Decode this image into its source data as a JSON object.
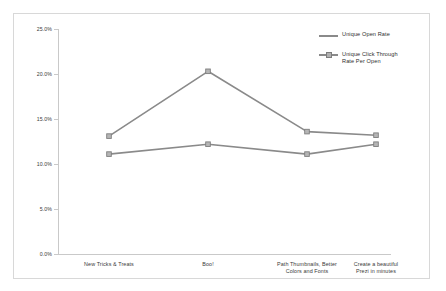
{
  "chart_data": {
    "type": "line",
    "title": "",
    "xlabel": "",
    "ylabel": "",
    "ylim": [
      0,
      25
    ],
    "ytick_values": [
      0,
      5,
      10,
      15,
      20,
      25
    ],
    "ytick_labels": [
      "0.0%",
      "5.0%",
      "10.0%",
      "15.0%",
      "20.0%",
      "25.0%"
    ],
    "grid": false,
    "legend_position": "top-right",
    "categories": [
      "New Tricks & Treats",
      "Boo!",
      "Path Thumbnails, Better\nColors and Fonts",
      "Create a beautiful\nPrezi in minutes"
    ],
    "series": [
      {
        "name": "Unique Open Rate",
        "color": "#8a8a8a",
        "marker": "square",
        "values": [
          13.1,
          20.3,
          13.6,
          13.2
        ]
      },
      {
        "name": "Unique Click Through\nRate Per Open",
        "color": "#8a8a8a",
        "marker": "square",
        "values": [
          11.1,
          12.2,
          11.1,
          12.2
        ]
      }
    ]
  },
  "legend": {
    "items": [
      {
        "label": "Unique Open Rate"
      },
      {
        "label": "Unique Click Through\nRate Per Open"
      }
    ]
  },
  "axis": {
    "y": {
      "t0": "0.0%",
      "t1": "5.0%",
      "t2": "10.0%",
      "t3": "15.0%",
      "t4": "20.0%",
      "t5": "25.0%"
    },
    "x": {
      "c0": "New Tricks & Treats",
      "c1": "Boo!",
      "c2": "Path Thumbnails, Better\nColors and Fonts",
      "c3": "Create a beautiful\nPrezi in minutes"
    }
  }
}
